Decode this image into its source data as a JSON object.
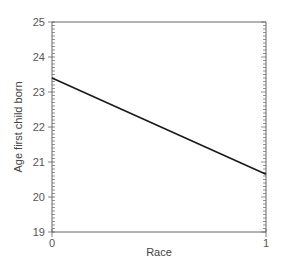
{
  "chart_data": {
    "type": "line",
    "title": "",
    "xlabel": "Race",
    "ylabel": "Age first child born",
    "x": [
      0,
      1
    ],
    "series": [
      {
        "name": "Age first child born",
        "values": [
          23.4,
          20.65
        ]
      }
    ],
    "xlim": [
      0,
      1
    ],
    "ylim": [
      19,
      25
    ],
    "x_ticks": [
      "0",
      "1"
    ],
    "y_ticks": [
      "19",
      "20",
      "21",
      "22",
      "23",
      "24",
      "25"
    ],
    "y_minor_tick_step": 0.1,
    "grid": false,
    "legend": "none",
    "frame": "box"
  },
  "colors": {
    "line": "#1a1a1a",
    "axis": "#666666",
    "text": "#555555"
  }
}
